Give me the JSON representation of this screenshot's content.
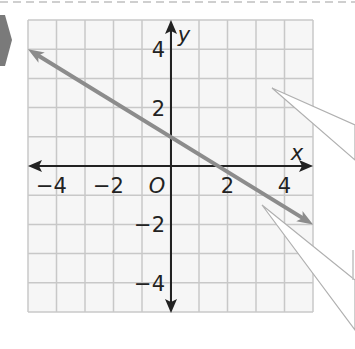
{
  "chart_data": {
    "type": "line",
    "title": "",
    "xlabel": "x",
    "ylabel": "y",
    "origin_label": "O",
    "xlim": [
      -5,
      5
    ],
    "ylim": [
      -5,
      5
    ],
    "grid": true,
    "grid_step": 1,
    "x_ticks": [
      -4,
      -2,
      2,
      4
    ],
    "x_tick_labels": [
      "−4",
      "−2",
      "2",
      "4"
    ],
    "y_ticks": [
      4,
      2,
      -2,
      -4
    ],
    "y_tick_labels": [
      "4",
      "2",
      "−2",
      "−4"
    ],
    "series": [
      {
        "name": "line",
        "equation": "y = -0.6x + 1",
        "slope": -0.6,
        "y_intercept": 1,
        "x_intercept": 1.67,
        "x": [
          -5,
          5
        ],
        "y": [
          4,
          -2
        ],
        "arrows_both_ends": true,
        "color": "#8c8c8c"
      }
    ],
    "callouts": 2
  },
  "colors": {
    "grid": "#c8c8c8",
    "axis": "#222222",
    "line": "#8c8c8c",
    "marker": "#7a7a7a",
    "dashes": "#c8c8c8"
  }
}
